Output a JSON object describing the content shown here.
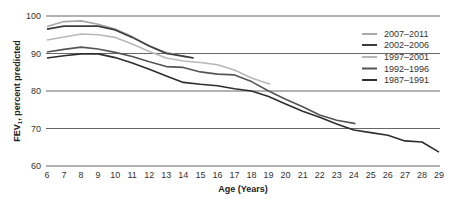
{
  "chart_data": {
    "type": "line",
    "title": "",
    "xlabel": "Age (Years)",
    "ylabel": "FEV1, percent predicted",
    "ylabel_main": "FEV",
    "ylabel_sub": "1",
    "ylabel_rest": ", percent predicted",
    "xlim": [
      6,
      29
    ],
    "ylim": [
      60,
      100
    ],
    "x_ticks": [
      6,
      7,
      8,
      9,
      10,
      11,
      12,
      13,
      14,
      15,
      16,
      17,
      18,
      19,
      20,
      21,
      22,
      23,
      24,
      25,
      26,
      27,
      28,
      29
    ],
    "y_ticks": [
      60,
      70,
      80,
      90,
      100
    ],
    "grid": "horizontal",
    "legend_position": "upper right",
    "series": [
      {
        "name": "2007–2011",
        "color": "#a8a8a8",
        "x": [
          6,
          7,
          8,
          9,
          10,
          11,
          12,
          13,
          14,
          14.6
        ],
        "values": [
          97.2,
          98.5,
          98.7,
          97.8,
          96.5,
          94.5,
          92.0,
          90.3,
          89.2,
          88.8
        ]
      },
      {
        "name": "2002–2006",
        "color": "#3c3c3c",
        "x": [
          6,
          7,
          8,
          9,
          10,
          11,
          12,
          13,
          14,
          14.6
        ],
        "values": [
          96.5,
          97.3,
          97.3,
          97.3,
          96.3,
          94.3,
          92.0,
          90.0,
          89.3,
          88.8
        ]
      },
      {
        "name": "1997–2001",
        "color": "#b8b8b8",
        "x": [
          6,
          7,
          8,
          9,
          10,
          11,
          12,
          13,
          14,
          15,
          16,
          17,
          18,
          19.1
        ],
        "values": [
          93.6,
          94.4,
          95.2,
          95.0,
          94.3,
          92.5,
          90.5,
          88.8,
          88.0,
          87.6,
          87.0,
          85.6,
          83.5,
          81.8
        ]
      },
      {
        "name": "1992–1996",
        "color": "#555555",
        "x": [
          6,
          7,
          8,
          9,
          10,
          11,
          12,
          13,
          14,
          15,
          16,
          17,
          18,
          19,
          20,
          21,
          22,
          23,
          24.1
        ],
        "values": [
          90.4,
          91.1,
          91.7,
          91.2,
          90.3,
          89.2,
          87.8,
          86.5,
          86.3,
          85.1,
          84.5,
          84.3,
          82.5,
          80.0,
          77.8,
          75.8,
          73.6,
          72.2,
          71.3
        ]
      },
      {
        "name": "1987–1991",
        "color": "#2e2e2e",
        "x": [
          6,
          7,
          8,
          9,
          10,
          11,
          12,
          13,
          14,
          15,
          16,
          17,
          18,
          19,
          20,
          21,
          22,
          23,
          24,
          25,
          26,
          27,
          28,
          29
        ],
        "values": [
          88.8,
          89.4,
          89.9,
          89.9,
          88.9,
          87.5,
          85.8,
          84.0,
          82.3,
          81.8,
          81.4,
          80.6,
          80.0,
          78.5,
          76.5,
          74.6,
          73.0,
          71.2,
          69.6,
          68.9,
          68.2,
          66.7,
          66.4,
          63.7
        ]
      }
    ]
  },
  "legend": {
    "items": [
      {
        "label": "2007–2011",
        "color": "#a8a8a8"
      },
      {
        "label": "2002–2006",
        "color": "#3c3c3c"
      },
      {
        "label": "1997–2001",
        "color": "#b8b8b8"
      },
      {
        "label": "1992–1996",
        "color": "#555555"
      },
      {
        "label": "1987–1991",
        "color": "#2e2e2e"
      }
    ]
  }
}
